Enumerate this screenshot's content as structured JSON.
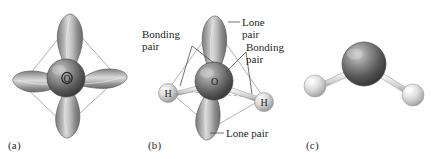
{
  "figure": {
    "background_color": "#ffffff"
  },
  "panels": [
    {
      "id": "a",
      "caption": "(a)",
      "description": "sp3 hybrid orbitals on oxygen arranged toward the corners of a tetrahedron",
      "center_atom_label": "O",
      "orbital_count": 4,
      "show_tetrahedron": true,
      "show_hydrogens": false,
      "labels": []
    },
    {
      "id": "b",
      "caption": "(b)",
      "description": "Oxygen sp3 orbitals with two bonding pairs to hydrogen and two lone pairs",
      "center_atom_label": "O",
      "hydrogen_labels": [
        "H",
        "H"
      ],
      "orbital_count": 4,
      "show_tetrahedron": true,
      "show_hydrogens": true,
      "labels": [
        {
          "key": "lone_pair_top",
          "text_line1": "Lone",
          "text_line2": "pair"
        },
        {
          "key": "bonding_pair_left",
          "text_line1": "Bonding",
          "text_line2": "pair"
        },
        {
          "key": "bonding_pair_right",
          "text_line1": "Bonding",
          "text_line2": "pair"
        },
        {
          "key": "lone_pair_bottom",
          "text_line1": "Lone pair",
          "text_line2": ""
        }
      ]
    },
    {
      "id": "c",
      "caption": "(c)",
      "description": "Ball-and-stick model of the bent water molecule",
      "center_atom_label": "",
      "hydrogen_labels": [
        "",
        ""
      ],
      "orbital_count": 0,
      "show_tetrahedron": false,
      "show_hydrogens": true,
      "labels": []
    }
  ],
  "colors": {
    "oxygen_sphere_dark": "#4a4a4a",
    "oxygen_sphere_light": "#b9b9b9",
    "hydrogen_sphere_dark": "#a8a8a8",
    "hydrogen_sphere_light": "#f2f2f2",
    "orbital_dark": "#6f6f6f",
    "orbital_light": "#c9c9c9",
    "tetrahedron_line": "#8c8c8c",
    "hidden_edge_line": "#9a9a9a",
    "leader_line": "#4a4a4a",
    "text": "#231f20",
    "background": "#ffffff"
  }
}
